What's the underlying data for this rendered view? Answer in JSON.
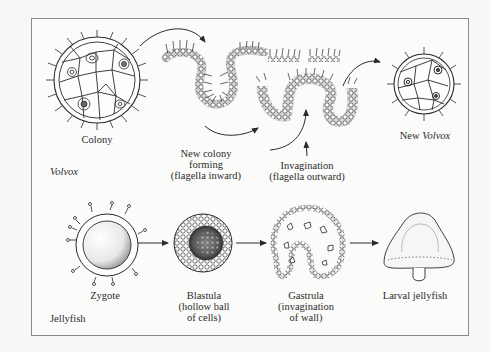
{
  "diagram": {
    "rows": [
      {
        "organism": "Volvox",
        "organism_italic": true,
        "stages": [
          {
            "id": "colony",
            "label_lines": [
              "Colony"
            ]
          },
          {
            "id": "new-colony-forming",
            "label_lines": [
              "New colony",
              "forming",
              "(flagella inward)"
            ]
          },
          {
            "id": "invagination",
            "label_lines": [
              "Invagination",
              "(flagella outward)"
            ]
          },
          {
            "id": "new-volvox",
            "label_prefix": "New ",
            "label_italic": "Volvox"
          }
        ],
        "arrows": [
          {
            "from": "colony",
            "to": "new-colony-forming",
            "style": "curved"
          },
          {
            "from": "new-colony-forming",
            "to": "invagination",
            "style": "curved"
          },
          {
            "from": "invagination",
            "to": "new-volvox",
            "style": "curved"
          },
          {
            "from": "invagination-label",
            "to": "invagination",
            "style": "pointer"
          }
        ]
      },
      {
        "organism": "Jellyfish",
        "organism_italic": false,
        "stages": [
          {
            "id": "zygote",
            "label_lines": [
              "Zygote"
            ]
          },
          {
            "id": "blastula",
            "label_lines": [
              "Blastula",
              "(hollow ball",
              "of cells)"
            ]
          },
          {
            "id": "gastrula",
            "label_lines": [
              "Gastrula",
              "(invagination",
              "of wall)"
            ]
          },
          {
            "id": "larval-jellyfish",
            "label_lines": [
              "Larval jellyfish"
            ]
          }
        ],
        "arrows": [
          {
            "from": "zygote",
            "to": "blastula",
            "style": "straight"
          },
          {
            "from": "blastula",
            "to": "gastrula",
            "style": "straight"
          },
          {
            "from": "gastrula",
            "to": "larval-jellyfish",
            "style": "straight"
          }
        ]
      }
    ],
    "colors": {
      "ink": "#2a2a2a",
      "frame": "#8a8a8a",
      "paper": "#fbfbf9",
      "background": "#f7f7f5"
    }
  },
  "labels": {
    "colony": "Colony",
    "new_colony_1": "New colony",
    "new_colony_2": "forming",
    "new_colony_3": "(flagella inward)",
    "invagination_1": "Invagination",
    "invagination_2": "(flagella outward)",
    "new_volvox_prefix": "New ",
    "new_volvox_italic": "Volvox",
    "volvox": "Volvox",
    "zygote": "Zygote",
    "blastula_1": "Blastula",
    "blastula_2": "(hollow ball",
    "blastula_3": "of cells)",
    "gastrula_1": "Gastrula",
    "gastrula_2": "(invagination",
    "gastrula_3": "of wall)",
    "larval": "Larval jellyfish",
    "jellyfish": "Jellyfish"
  }
}
